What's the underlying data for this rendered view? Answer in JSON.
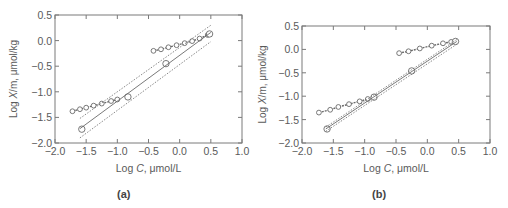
{
  "chart_data": [
    {
      "type": "scatter",
      "panel_label": "(a)",
      "xlabel": "Log C, μmol/L",
      "ylabel": "Log X/m, μmol/kg",
      "xlim": [
        -2.0,
        1.0
      ],
      "ylim": [
        -2.0,
        0.5
      ],
      "xticks": [
        "−2.0",
        "−1.5",
        "−1.0",
        "−0.5",
        "0.0",
        "0.5",
        "1.0"
      ],
      "yticks": [
        "0.5",
        "0.0",
        "−0.5",
        "−1.0",
        "−1.5",
        "−2.0"
      ],
      "grid": false,
      "series": [
        {
          "name": "low-concentration cluster",
          "marker": "diamond",
          "x": [
            -1.72,
            -1.6,
            -1.5,
            -1.38,
            -1.25,
            -1.1,
            -1.0
          ],
          "y": [
            -1.38,
            -1.34,
            -1.31,
            -1.27,
            -1.23,
            -1.18,
            -1.15
          ]
        },
        {
          "name": "high-concentration cluster",
          "marker": "diamond",
          "x": [
            -0.42,
            -0.3,
            -0.18,
            -0.05,
            0.08,
            0.2,
            0.32,
            0.45
          ],
          "y": [
            -0.2,
            -0.17,
            -0.13,
            -0.09,
            -0.05,
            -0.01,
            0.04,
            0.11
          ]
        },
        {
          "name": "isotherm fit points",
          "marker": "circle",
          "x": [
            -1.57,
            -0.83,
            -0.22,
            0.48
          ],
          "y": [
            -1.73,
            -1.1,
            -0.45,
            0.13
          ]
        },
        {
          "name": "fit line",
          "line": "solid",
          "x": [
            -1.6,
            0.5
          ],
          "y": [
            -1.72,
            0.16
          ]
        },
        {
          "name": "upper confidence band",
          "line": "dotted",
          "x": [
            -1.6,
            0.5
          ],
          "y": [
            -1.52,
            0.3
          ]
        },
        {
          "name": "lower confidence band",
          "line": "dotted",
          "x": [
            -1.6,
            0.5
          ],
          "y": [
            -1.9,
            -0.02
          ]
        }
      ]
    },
    {
      "type": "scatter",
      "panel_label": "(b)",
      "xlabel": "Log C, μmol/L",
      "ylabel": "Log X/m, μmol/kg",
      "xlim": [
        -2.0,
        1.0
      ],
      "ylim": [
        -2.0,
        0.5
      ],
      "xticks": [
        "−2.0",
        "−1.5",
        "−1.0",
        "−0.5",
        "0.0",
        "0.5",
        "1.0"
      ],
      "yticks": [
        "0.5",
        "0.0",
        "−0.5",
        "−1.0",
        "−1.5",
        "−2.0"
      ],
      "grid": false,
      "series": [
        {
          "name": "low-concentration cluster",
          "marker": "diamond",
          "x": [
            -1.73,
            -1.55,
            -1.42,
            -1.25,
            -1.08,
            -0.95,
            -0.85
          ],
          "y": [
            -1.35,
            -1.29,
            -1.23,
            -1.17,
            -1.11,
            -1.06,
            -1.02
          ]
        },
        {
          "name": "high-concentration cluster",
          "marker": "diamond",
          "x": [
            -0.45,
            -0.3,
            -0.12,
            0.07,
            0.25,
            0.38,
            0.45
          ],
          "y": [
            -0.08,
            -0.04,
            0.02,
            0.08,
            0.13,
            0.16,
            0.17
          ]
        },
        {
          "name": "isotherm fit points",
          "marker": "circle",
          "x": [
            -1.6,
            -0.85,
            -0.25,
            0.45
          ],
          "y": [
            -1.7,
            -1.02,
            -0.46,
            0.17
          ]
        },
        {
          "name": "fit line",
          "line": "solid",
          "x": [
            -1.62,
            0.47
          ],
          "y": [
            -1.7,
            0.17
          ]
        },
        {
          "name": "upper confidence band",
          "line": "dotted",
          "x": [
            -1.62,
            0.47
          ],
          "y": [
            -1.66,
            0.21
          ]
        },
        {
          "name": "lower confidence band",
          "line": "dotted",
          "x": [
            -1.62,
            0.47
          ],
          "y": [
            -1.75,
            0.11
          ]
        }
      ]
    }
  ],
  "captions": {
    "a": "(a)",
    "b": "(b)"
  },
  "axis_labels": {
    "x_prefix": "Log ",
    "x_var": "C",
    "x_unit": ", μmol/L",
    "y_prefix": "Log ",
    "y_var": "X",
    "y_unit": "/m, μmol/kg"
  },
  "colors": {
    "axis": "#7a7a7a",
    "marker": "#6a6a6a",
    "line": "#6a6a6a",
    "text": "#5a5a5a"
  }
}
